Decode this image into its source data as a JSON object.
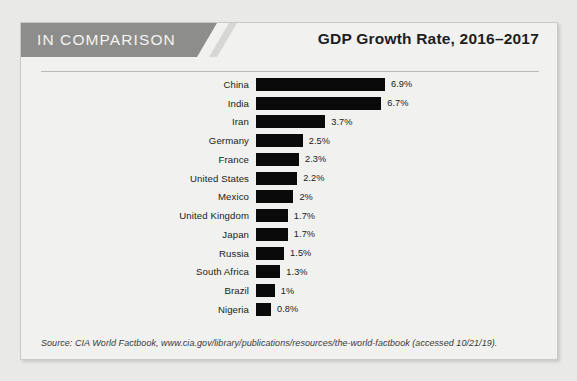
{
  "page": {
    "background_color": "#e9e9e7",
    "bleed_text": "lorem ipsum dolor sit amet consectetur adipiscing elit sed do eiusmod tempor incididunt ut labore et dolore magna aliqua enim ad minim veniam quis nostrud exercitation ullamco laboris nisi ut aliquip ex ea commodo consequat duis aute irure dolor in reprehenderit in voluptate velit esse cillum dolore eu fugiat nulla pariatur excepteur sint occaecat cupidatat non proident sunt in culpa qui officia deserunt mollit anim id est laborum sed ut perspiciatis unde omnis iste natus error sit voluptatem accusantium doloremque laudantium totam rem aperiam eaque ipsa quae ab illo inventore veritatis et quasi architecto beatae vitae dicta sunt explicabo nemo enim ipsam voluptatem quia voluptas sit aspernatur aut odit aut fugit sed quia consequuntur magni dolores eos qui ratione voluptatem sequi nesciunt neque porro quisquam est qui dolorem ipsum quia dolor sit amet consectetur adipisci velit sed quia non numquam eius modi tempora incidunt ut labore et dolore magnam aliquam quaerat voluptatem"
  },
  "card": {
    "background_color": "#f1f1ef",
    "border_color": "#c9c9c6"
  },
  "header": {
    "banner_label": "IN COMPARISON",
    "banner_color": "#8d8d8c",
    "banner_text_color": "#f3f3f1",
    "chart_title": "GDP Growth Rate, 2016–2017"
  },
  "footer": {
    "source": "Source: CIA World Factbook, www.cia.gov/library/publications/resources/the-world-factbook (accessed 10/21/19)."
  },
  "chart_data": {
    "type": "bar",
    "orientation": "horizontal",
    "title": "GDP Growth Rate, 2016–2017",
    "xlabel": "",
    "ylabel": "",
    "xlim": [
      0,
      6.9
    ],
    "grid": false,
    "legend": null,
    "bar_color": "#0a0a0a",
    "unit": "%",
    "categories": [
      "China",
      "India",
      "Iran",
      "Germany",
      "France",
      "United States",
      "Mexico",
      "United Kingdom",
      "Japan",
      "Russia",
      "South Africa",
      "Brazil",
      "Nigeria"
    ],
    "values": [
      6.9,
      6.7,
      3.7,
      2.5,
      2.3,
      2.2,
      2,
      1.7,
      1.7,
      1.5,
      1.3,
      1,
      0.8
    ],
    "value_labels": [
      "6.9%",
      "6.7%",
      "3.7%",
      "2.5%",
      "2.3%",
      "2.2%",
      "2%",
      "1.7%",
      "1.7%",
      "1.5%",
      "1.3%",
      "1%",
      "0.8%"
    ]
  }
}
